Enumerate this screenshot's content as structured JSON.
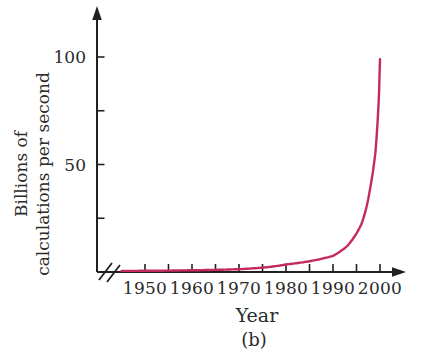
{
  "chart_data": {
    "type": "line",
    "title": "",
    "xlabel": "Year",
    "ylabel": "Billions of calculations per second",
    "ylabel_lines": [
      "Billions of",
      "calculations per second"
    ],
    "caption": "(b)",
    "grid": false,
    "legend": false,
    "axis_break_on_x": true,
    "xlim": [
      1945,
      2004
    ],
    "ylim": [
      0,
      118
    ],
    "x_tick_labels": [
      "1950",
      "1960",
      "1970",
      "1980",
      "1990",
      "2000"
    ],
    "x_ticks_labeled_years": [
      1950,
      1960,
      1970,
      1980,
      1990,
      2000
    ],
    "x_minor_tick_years": [
      1955,
      1965,
      1975,
      1985,
      1995
    ],
    "y_tick_labels": [
      "50",
      "100"
    ],
    "y_ticks_labeled_values": [
      50,
      100
    ],
    "y_minor_tick_values": [
      25,
      75
    ],
    "colors": {
      "curve": "#c42a5c",
      "axis": "#231f20",
      "text": "#2b2b2b",
      "background": "#ffffff"
    },
    "series": [
      {
        "name": "billions of calculations per second",
        "color": "#c42a5c",
        "points": [
          [
            1945,
            0.5
          ],
          [
            1950,
            0.55
          ],
          [
            1955,
            0.65
          ],
          [
            1960,
            0.8
          ],
          [
            1965,
            1.0
          ],
          [
            1970,
            1.3
          ],
          [
            1975,
            2.0
          ],
          [
            1980,
            3.5
          ],
          [
            1985,
            5.0
          ],
          [
            1990,
            7.5
          ],
          [
            1993,
            12
          ],
          [
            1995,
            18
          ],
          [
            1996,
            22
          ],
          [
            1997,
            29
          ],
          [
            1998,
            40
          ],
          [
            1999,
            55
          ],
          [
            1999.5,
            70
          ],
          [
            1999.8,
            84
          ],
          [
            2000,
            99
          ]
        ]
      }
    ]
  }
}
